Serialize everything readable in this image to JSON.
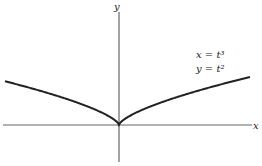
{
  "diagram": {
    "type": "parametric-curve",
    "axes": {
      "x_label": "x",
      "y_label": "y"
    },
    "equations": {
      "line1": "x = t³",
      "line2": "y = t²"
    },
    "curve": "semicubical parabola (cusp at origin)",
    "colors": {
      "axis": "#555555",
      "curve": "#222222",
      "text": "#222222"
    }
  }
}
